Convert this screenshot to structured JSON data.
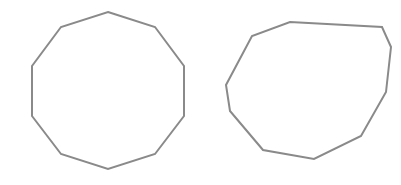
{
  "canvas": {
    "width": 401,
    "height": 185,
    "background": "#ffffff"
  },
  "style": {
    "stroke_color": "#8a8a8a",
    "stroke_width": 2
  },
  "shapes": [
    {
      "name": "regular-decagon",
      "description": "Regular decagon (10 equal sides)",
      "sides": 10,
      "regular": true,
      "points": [
        [
          108,
          12
        ],
        [
          155,
          27
        ],
        [
          184,
          66
        ],
        [
          184,
          116
        ],
        [
          155,
          154
        ],
        [
          108,
          169
        ],
        [
          61,
          154
        ],
        [
          32,
          116
        ],
        [
          32,
          66
        ],
        [
          61,
          27
        ]
      ]
    },
    {
      "name": "irregular-decagon",
      "description": "Irregular decagon (10 unequal sides)",
      "sides": 10,
      "regular": false,
      "points": [
        [
          290,
          22
        ],
        [
          382,
          27
        ],
        [
          391,
          47
        ],
        [
          386,
          92
        ],
        [
          361,
          136
        ],
        [
          314,
          159
        ],
        [
          263,
          150
        ],
        [
          230,
          111
        ],
        [
          226,
          85
        ],
        [
          252,
          36
        ]
      ]
    }
  ]
}
